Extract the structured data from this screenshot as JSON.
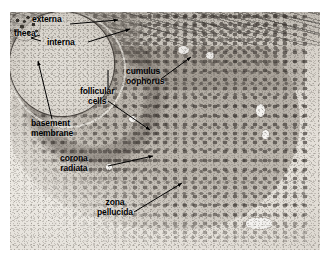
{
  "figure": {
    "kind": "histology-micrograph",
    "palette": {
      "background": "#ffffff",
      "tissue_light": "#efece6",
      "tissue_mid": "#bdb7ae",
      "tissue_dark": "#3a3430",
      "label_text": "#000000",
      "leader_line": "#000000"
    },
    "plate": {
      "left": 10,
      "top": 12,
      "width": 310,
      "height": 238
    }
  },
  "labels": [
    {
      "id": "theca",
      "text": "theca",
      "x": 16,
      "y": 34
    },
    {
      "id": "theca-externa",
      "text": "externa",
      "x": 33,
      "y": 20
    },
    {
      "id": "theca-interna",
      "text": "interna",
      "x": 48,
      "y": 43
    },
    {
      "id": "cumulus-oophorus",
      "line1": "cumulus",
      "line2": "oophorus",
      "x": 128,
      "y": 72
    },
    {
      "id": "follicular-cells",
      "line1": "follicular",
      "line2": "cells",
      "x": 82,
      "y": 92
    },
    {
      "id": "basement-membrane",
      "line1": "basement",
      "line2": "membrane",
      "x": 33,
      "y": 124
    },
    {
      "id": "corona-radiata",
      "line1": "corona",
      "line2": "radiata",
      "x": 62,
      "y": 159
    },
    {
      "id": "zona-pellucida",
      "line1": "zona",
      "line2": "pellucida",
      "x": 99,
      "y": 203
    }
  ],
  "leader_lines": [
    {
      "id": "lead-externa",
      "from": [
        70,
        24
      ],
      "to": [
        118,
        20
      ],
      "arrow": true,
      "label": "theca externa"
    },
    {
      "id": "lead-interna",
      "from": [
        88,
        42
      ],
      "to": [
        128,
        30
      ],
      "arrow": true,
      "label": "theca interna"
    },
    {
      "id": "lead-brace",
      "from": [
        32,
        38
      ],
      "to": [
        44,
        34
      ],
      "arrow": false,
      "label": "theca brace"
    },
    {
      "id": "lead-cumulus",
      "from": [
        160,
        78
      ],
      "to": [
        190,
        58
      ],
      "arrow": true,
      "label": "cumulus oophorus"
    },
    {
      "id": "lead-follicular",
      "from": [
        108,
        68
      ],
      "to": [
        108,
        90
      ],
      "arrow": true,
      "label": "follicular cells vertical tick"
    },
    {
      "id": "lead-follicular2",
      "from": [
        128,
        100
      ],
      "to": [
        148,
        128
      ],
      "arrow": true,
      "label": "follicular cells to granulosa"
    },
    {
      "id": "lead-basement",
      "from": [
        52,
        120
      ],
      "to": [
        38,
        62
      ],
      "arrow": true,
      "label": "basement membrane"
    },
    {
      "id": "lead-corona",
      "from": [
        108,
        166
      ],
      "to": [
        152,
        156
      ],
      "arrow": true,
      "label": "corona radiata"
    },
    {
      "id": "lead-zona",
      "from": [
        133,
        212
      ],
      "to": [
        181,
        184
      ],
      "arrow": true,
      "label": "zona pellucida"
    }
  ],
  "structures": [
    {
      "id": "theca-externa-band",
      "label": "theca externa — fibrous outer capsule"
    },
    {
      "id": "theca-interna-band",
      "label": "theca interna — vascular secretory layer"
    },
    {
      "id": "basement-membrane-line",
      "label": "basement membrane separating theca from granulosa"
    },
    {
      "id": "granulosa-layer",
      "label": "stratum granulosum / follicular cells"
    },
    {
      "id": "follicular-antrum",
      "label": "antrum filled with follicular fluid"
    },
    {
      "id": "cumulus-oophorus-mass",
      "label": "cumulus oophorus suspending the oocyte"
    },
    {
      "id": "corona-radiata-ring",
      "label": "corona radiata — innermost granulosa collar"
    },
    {
      "id": "zona-pellucida-ring",
      "label": "zona pellucida glycoprotein coat"
    },
    {
      "id": "oocyte-body",
      "label": "primary oocyte"
    },
    {
      "id": "oocyte-nucleus",
      "label": "germinal vesicle with chromatin"
    }
  ]
}
